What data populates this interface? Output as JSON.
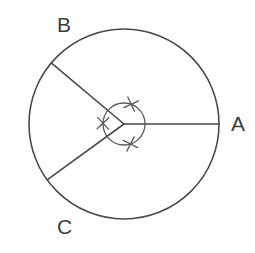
{
  "figure": {
    "canvas": {
      "width": 255,
      "height": 253,
      "background": "#ffffff"
    },
    "stroke_color": "#4a4a4a",
    "arc_color": "#5a5a5a",
    "label_color": "#3d3d3d"
  },
  "circle": {
    "name": "main-circle",
    "center_x": 124,
    "center_y": 124,
    "radius": 95
  },
  "center_arc": {
    "name": "central-angle-arc",
    "radius": 21
  },
  "radii": [
    {
      "id": "OA",
      "label": "A",
      "angle_deg": 0,
      "end_x": 219,
      "end_y": 124
    },
    {
      "id": "OB",
      "label": "B",
      "angle_deg": 140,
      "end_x": 51,
      "end_y": 63
    },
    {
      "id": "OC",
      "label": "C",
      "angle_deg": 216,
      "end_x": 47,
      "end_y": 180
    }
  ],
  "labels": {
    "A": "A",
    "B": "B",
    "C": "C"
  },
  "angle_ticks": [
    {
      "id": "tick-AOB",
      "between": "A and B",
      "bisector_deg": 70,
      "marks": 1
    },
    {
      "id": "tick-BOC",
      "between": "B and C",
      "bisector_deg": 178,
      "marks": 1
    },
    {
      "id": "tick-COA",
      "between": "C and A",
      "bisector_deg": 288,
      "marks": 1
    }
  ]
}
